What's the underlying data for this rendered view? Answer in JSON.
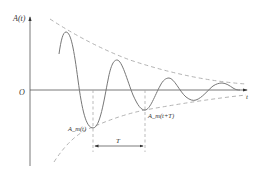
{
  "diagram": {
    "labels": {
      "y_axis": "A(t)",
      "origin": "O",
      "x_axis": "t",
      "trough_1": "A_m(t)",
      "trough_2": "A_m(t+T)",
      "period": "T"
    },
    "colors": {
      "axis": "#555555",
      "wave": "#777777",
      "envelope": "#aaaaaa",
      "text": "#333333"
    }
  }
}
